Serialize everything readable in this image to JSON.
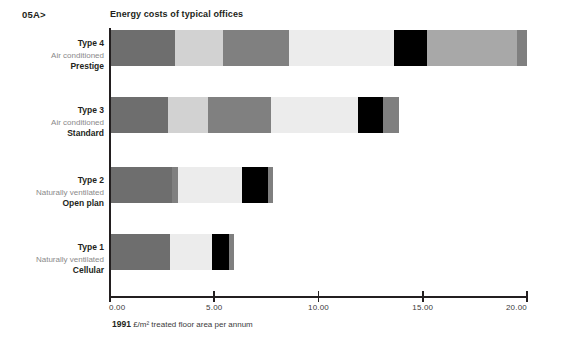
{
  "figure_number": "05A>",
  "title": "Energy costs of typical offices",
  "axis_caption_value": "1991",
  "axis_caption_text": " £/m² treated floor area per annum",
  "colors": {
    "dark_gray": "#6e6e6e",
    "light_gray": "#d2d2d2",
    "medium_gray": "#808080",
    "pale_gray": "#ececec",
    "black": "#000000",
    "mid_light_gray": "#a8a8a8",
    "edge_gray": "#7f7f7f",
    "text": "#231f20",
    "muted_text": "#8a8a8a"
  },
  "chart_data": {
    "type": "bar",
    "orientation": "horizontal",
    "stacked": true,
    "title": "Energy costs of typical offices",
    "xlabel": "1991 £/m² treated floor area per annum",
    "ylabel": "",
    "xlim": [
      0.0,
      20.0
    ],
    "xticks": [
      0.0,
      5.0,
      10.0,
      15.0,
      20.0
    ],
    "xticklabels": [
      "0.00",
      "5.00",
      "10.00",
      "15.00",
      "20.00"
    ],
    "grid": false,
    "legend": "none",
    "categories": [
      {
        "type": "Type 4",
        "ventilation": "Air conditioned",
        "grade": "Prestige"
      },
      {
        "type": "Type 3",
        "ventilation": "Air conditioned",
        "grade": "Standard"
      },
      {
        "type": "Type 2",
        "ventilation": "Naturally ventilated",
        "grade": "Open plan"
      },
      {
        "type": "Type 1",
        "ventilation": "Naturally ventilated",
        "grade": "Cellular"
      }
    ],
    "bars": [
      {
        "label": "Type 4 Air conditioned Prestige",
        "total": 20.0,
        "segments": [
          {
            "value": 3.1,
            "color": "#6e6e6e"
          },
          {
            "value": 2.3,
            "color": "#d2d2d2"
          },
          {
            "value": 3.2,
            "color": "#808080"
          },
          {
            "value": 5.0,
            "color": "#ececec"
          },
          {
            "value": 1.6,
            "color": "#000000"
          },
          {
            "value": 4.3,
            "color": "#a8a8a8"
          },
          {
            "value": 0.5,
            "color": "#7f7f7f"
          }
        ]
      },
      {
        "label": "Type 3 Air conditioned Standard",
        "total": 13.85,
        "segments": [
          {
            "value": 2.8,
            "color": "#6e6e6e"
          },
          {
            "value": 1.9,
            "color": "#d2d2d2"
          },
          {
            "value": 3.0,
            "color": "#808080"
          },
          {
            "value": 4.2,
            "color": "#ececec"
          },
          {
            "value": 1.2,
            "color": "#000000"
          },
          {
            "value": 0.75,
            "color": "#7f7f7f"
          }
        ]
      },
      {
        "label": "Type 2 Naturally ventilated Open plan",
        "total": 7.8,
        "segments": [
          {
            "value": 2.95,
            "color": "#6e6e6e"
          },
          {
            "value": 0.3,
            "color": "#808080"
          },
          {
            "value": 3.1,
            "color": "#ececec"
          },
          {
            "value": 1.25,
            "color": "#000000"
          },
          {
            "value": 0.2,
            "color": "#7f7f7f"
          }
        ]
      },
      {
        "label": "Type 1 Naturally ventilated Cellular",
        "total": 5.95,
        "segments": [
          {
            "value": 2.9,
            "color": "#6e6e6e"
          },
          {
            "value": 2.0,
            "color": "#ececec"
          },
          {
            "value": 0.8,
            "color": "#000000"
          },
          {
            "value": 0.25,
            "color": "#7f7f7f"
          }
        ]
      }
    ]
  }
}
